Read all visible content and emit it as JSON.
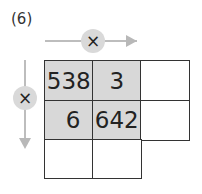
{
  "problem": {
    "label": "(6)"
  },
  "operators": {
    "horizontal": "×",
    "vertical": "×"
  },
  "grid": {
    "rows": [
      [
        {
          "value": "538",
          "shaded": true
        },
        {
          "value": "3",
          "shaded": true
        },
        {
          "value": "",
          "shaded": false
        }
      ],
      [
        {
          "value": "6",
          "shaded": true
        },
        {
          "value": "642",
          "shaded": true
        },
        {
          "value": "",
          "shaded": false
        }
      ],
      [
        {
          "value": "",
          "shaded": false
        },
        {
          "value": "",
          "shaded": false
        }
      ]
    ]
  },
  "colors": {
    "shade": "#d8d8d8",
    "arrow": "#bdbdbd",
    "border": "#333333"
  }
}
